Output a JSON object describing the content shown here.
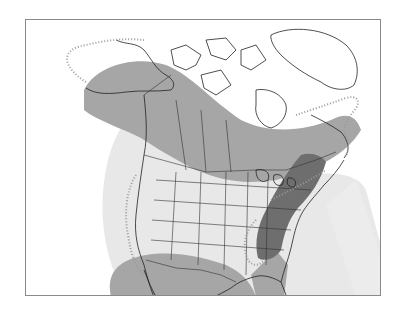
{
  "map": {
    "region": "North America",
    "type": "species range map",
    "zones": [
      {
        "name": "breeding-range",
        "color": "#a6a6a6"
      },
      {
        "name": "year-round-range",
        "color": "#6e6e6e"
      },
      {
        "name": "migration-range",
        "color": "#e8e8e8"
      },
      {
        "name": "rare-occurrence-boundary",
        "color": "#9a9a9a",
        "style": "dotted"
      }
    ],
    "colors": {
      "land": "#ffffff",
      "coastline": "#222222",
      "borders": "#333333",
      "frame": "#8a8a8a"
    }
  }
}
